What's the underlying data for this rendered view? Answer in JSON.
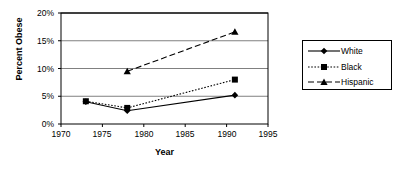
{
  "chart_data": {
    "type": "line",
    "title": "",
    "xlabel": "Year",
    "ylabel": "Percent Obese",
    "xlim": [
      1970,
      1995
    ],
    "ylim": [
      0,
      20
    ],
    "xticks": [
      "1970",
      "1975",
      "1980",
      "1985",
      "1990",
      "1995"
    ],
    "xtick_values": [
      1970,
      1975,
      1980,
      1985,
      1990,
      1995
    ],
    "yticks": [
      "0%",
      "5%",
      "10%",
      "15%",
      "20%"
    ],
    "ytick_values": [
      0,
      5,
      10,
      15,
      20
    ],
    "grid": "horizontal",
    "legend_position": "right",
    "x": [
      1973,
      1978,
      1991
    ],
    "series": [
      {
        "name": "White",
        "marker": "diamond",
        "line_style": "solid",
        "x": [
          1973,
          1978,
          1991
        ],
        "values": [
          4.0,
          2.4,
          5.2
        ]
      },
      {
        "name": "Black",
        "marker": "square",
        "line_style": "dotted",
        "x": [
          1973,
          1978,
          1991
        ],
        "values": [
          4.1,
          2.9,
          8.0
        ]
      },
      {
        "name": "Hispanic",
        "marker": "triangle",
        "line_style": "dashed",
        "x": [
          1978,
          1991
        ],
        "values": [
          9.5,
          16.6
        ]
      }
    ],
    "colors": {
      "line": "#000000",
      "grid": "#808080",
      "axis": "#000000",
      "background": "#ffffff"
    }
  },
  "legend": {
    "items": [
      {
        "label": "White"
      },
      {
        "label": "Black"
      },
      {
        "label": "Hispanic"
      }
    ]
  }
}
